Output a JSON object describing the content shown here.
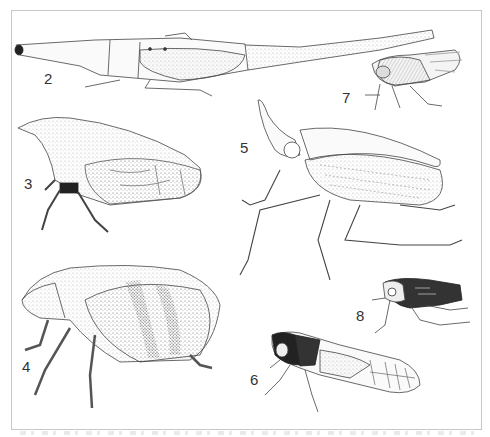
{
  "plate": {
    "border_color": "#c8c8c8",
    "ink_color": "#333333",
    "figures": [
      {
        "number": "2",
        "description": "elongated planthopper with long tapering head process, dorsal view"
      },
      {
        "number": "3",
        "description": "treehopper with stippled pronotum and veined wings, lateral view"
      },
      {
        "number": "4",
        "description": "rounded stippled hopper with banded wings and hairy legs, lateral view"
      },
      {
        "number": "5",
        "description": "lanternfly-like hopper with upturned head process and long spined legs"
      },
      {
        "number": "6",
        "description": "leafhopper with dark head and reticulate wing venation"
      },
      {
        "number": "7",
        "description": "small hopper with dark striped body and clear veined wings"
      },
      {
        "number": "8",
        "description": "small dark patterned nymph-like hopper"
      }
    ]
  }
}
